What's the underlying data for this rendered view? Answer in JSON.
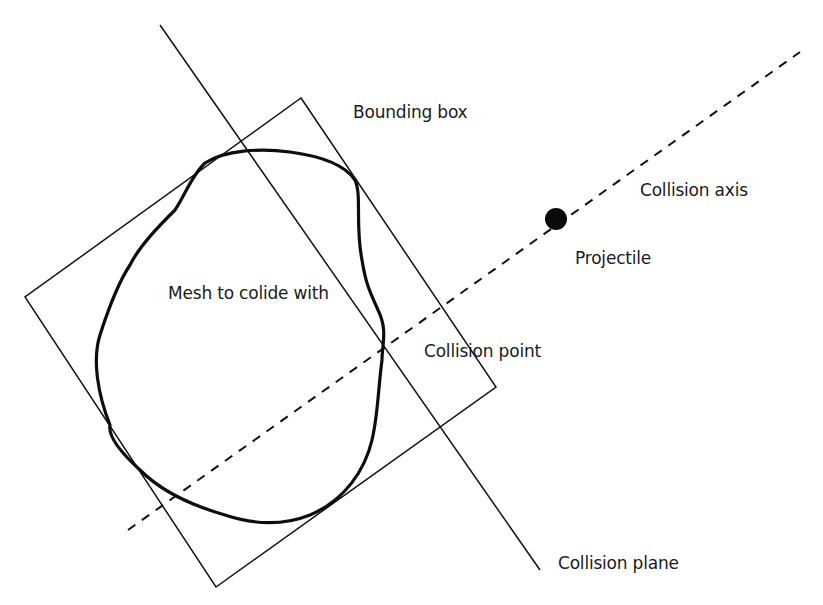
{
  "diagram": {
    "colors": {
      "background": "#ffffff",
      "stroke": "#111111",
      "text": "#1a1a1a"
    },
    "labels": {
      "bounding_box": "Bounding box",
      "collision_axis": "Collision axis",
      "projectile": "Projectile",
      "mesh": "Mesh to colide with",
      "collision_point": "Collision point",
      "collision_plane": "Collision plane"
    },
    "elements": {
      "bounding_box": {
        "shape": "rotated-rectangle",
        "corners": [
          [
            301,
            98
          ],
          [
            496,
            387
          ],
          [
            216,
            587
          ],
          [
            25,
            297
          ]
        ]
      },
      "collision_plane": {
        "shape": "line",
        "from": [
          160,
          25
        ],
        "to": [
          540,
          570
        ]
      },
      "collision_axis": {
        "shape": "dashed-line",
        "from": [
          128,
          530
        ],
        "to": [
          800,
          52
        ]
      },
      "projectile": {
        "shape": "filled-circle",
        "center": [
          556,
          219
        ],
        "radius": 11
      },
      "mesh": {
        "shape": "closed-blob",
        "stroke_width": 3
      },
      "collision_point": {
        "position": [
          384,
          345
        ]
      }
    }
  }
}
